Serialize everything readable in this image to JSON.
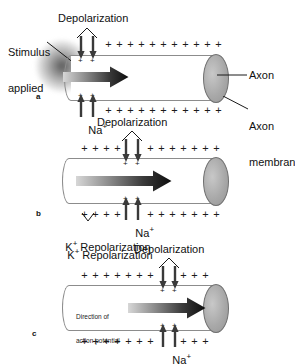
{
  "figure": {
    "background_color": "#ffffff",
    "ink_color": "#111111",
    "membrane_color": "#8c8c8c",
    "endcap_color": "#a9a9a9"
  },
  "labels": {
    "stimulus_applied": "Stimulus\napplied",
    "depolarization": "Depolarization",
    "axon": "Axon",
    "axon_membrane": "Axon\nmembrane",
    "sodium": "Na",
    "sodium_charge": "+",
    "potassium": "K",
    "potassium_charge": "+",
    "repolarization": "Repolarization",
    "direction_of_action_potential": "Direction of\naction potential"
  },
  "panels": [
    {
      "id": "a",
      "letter": "a",
      "charges_top": [
        "+",
        "+",
        "+",
        "+",
        "+",
        "+",
        "+",
        "+",
        "+",
        "+",
        "+"
      ],
      "charges_bottom": [
        "+",
        "+",
        "+",
        "+",
        "+",
        "+",
        "+",
        "+",
        "+",
        "+",
        "+"
      ],
      "depolarization_position": "left-end",
      "has_stimulus": true,
      "has_axon_callout": true,
      "has_membrane_callout": true,
      "has_repolarization": false,
      "has_direction_text": false,
      "inward_ion": "Na+",
      "inward_arrow_count": 2,
      "outward_arrow_count": 2
    },
    {
      "id": "b",
      "letter": "b",
      "charges_top": [
        "+",
        "+",
        "+",
        "+",
        "+",
        "+",
        "+",
        "+",
        "+",
        "+",
        "+"
      ],
      "charges_bottom": [
        "+",
        "+",
        "+",
        "+",
        "+",
        "+",
        "+",
        "+",
        "+",
        "+",
        "+"
      ],
      "depolarization_position": "middle",
      "has_stimulus": false,
      "has_axon_callout": false,
      "has_membrane_callout": false,
      "has_repolarization": true,
      "has_direction_text": false,
      "inward_ion": "Na+",
      "inward_arrow_count": 2,
      "outward_arrow_count": 2
    },
    {
      "id": "c",
      "letter": "c",
      "charges_top": [
        "+",
        "+",
        "+",
        "+",
        "+",
        "+",
        "+",
        "+",
        "+",
        "+",
        "+"
      ],
      "charges_bottom": [
        "+",
        "+",
        "+",
        "+",
        "+",
        "+",
        "+",
        "+",
        "+",
        "+",
        "+"
      ],
      "depolarization_position": "right",
      "has_stimulus": false,
      "has_axon_callout": false,
      "has_membrane_callout": false,
      "has_repolarization": false,
      "has_direction_text": true,
      "inward_ion": "Na+",
      "inward_arrow_count": 2,
      "outward_arrow_count": 2
    }
  ]
}
